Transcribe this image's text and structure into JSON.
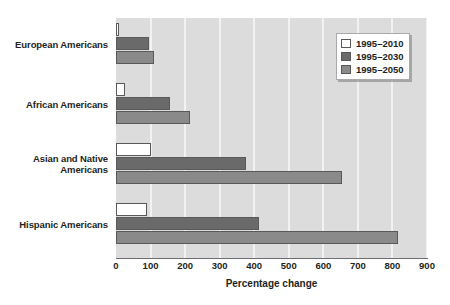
{
  "chart_data": {
    "type": "bar",
    "orientation": "horizontal",
    "title": "",
    "xlabel": "Percentage change",
    "ylabel": "",
    "xlim": [
      0,
      900
    ],
    "xticks": [
      0,
      100,
      200,
      300,
      400,
      500,
      600,
      700,
      800,
      900
    ],
    "grid": "vertical-white-gridlines",
    "categories": [
      "European Americans",
      "African Americans",
      "Asian and Native Americans",
      "Hispanic Americans"
    ],
    "category_lines": [
      [
        "European Americans"
      ],
      [
        "African Americans"
      ],
      [
        "Asian and Native",
        "Americans"
      ],
      [
        "Hispanic Americans"
      ]
    ],
    "series": [
      {
        "name": "1995–2010",
        "color": "#ffffff",
        "values": [
          10,
          25,
          100,
          90
        ]
      },
      {
        "name": "1995–2030",
        "color": "#6a6a6a",
        "values": [
          95,
          155,
          375,
          415
        ]
      },
      {
        "name": "1995–2050",
        "color": "#8a8a8a",
        "values": [
          110,
          215,
          655,
          815
        ]
      }
    ],
    "legend": {
      "position": "top-right",
      "entries": [
        "1995–2010",
        "1995–2030",
        "1995–2050"
      ]
    },
    "colors": {
      "plot_background": "#dcdcdc",
      "gridline": "#f2f2f2",
      "axis": "#6d6e71",
      "bar_outline": "#58595b",
      "text": "#231f20",
      "page_background": "#ffffff"
    }
  }
}
